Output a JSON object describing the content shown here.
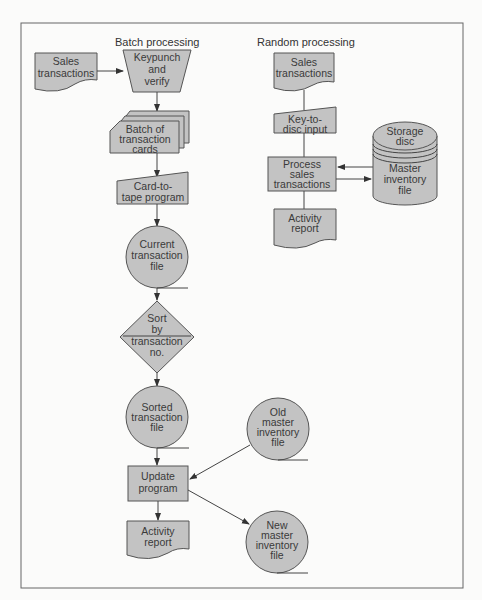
{
  "diagram": {
    "type": "flowchart",
    "colors": {
      "shape_fill": "#c3c3c3",
      "stroke": "#555555",
      "background": "#fbfbfa"
    },
    "batch": {
      "title": "Batch processing",
      "sales_transactions": [
        "Sales",
        "transactions"
      ],
      "keypunch": [
        "Keypunch",
        "and",
        "verify"
      ],
      "batch_cards": [
        "Batch of",
        "transaction",
        "cards"
      ],
      "card_to_tape": [
        "Card-to-",
        "tape program"
      ],
      "current_file": [
        "Current",
        "transaction",
        "file"
      ],
      "sort": [
        "Sort",
        "by",
        "transaction",
        "no."
      ],
      "sorted_file": [
        "Sorted",
        "transaction",
        "file"
      ],
      "old_master": [
        "Old",
        "master",
        "inventory",
        "file"
      ],
      "update_program": [
        "Update",
        "program"
      ],
      "activity_report": [
        "Activity",
        "report"
      ],
      "new_master": [
        "New",
        "master",
        "inventory",
        "file"
      ]
    },
    "random": {
      "title": "Random processing",
      "sales_transactions": [
        "Sales",
        "transactions"
      ],
      "key_to_disc": [
        "Key-to-",
        "disc input"
      ],
      "process": [
        "Process",
        "sales",
        "transactions"
      ],
      "activity_report": [
        "Activity",
        "report"
      ],
      "storage_disc": [
        "Storage",
        "disc"
      ],
      "master_file": [
        "Master",
        "inventory",
        "file"
      ]
    }
  }
}
